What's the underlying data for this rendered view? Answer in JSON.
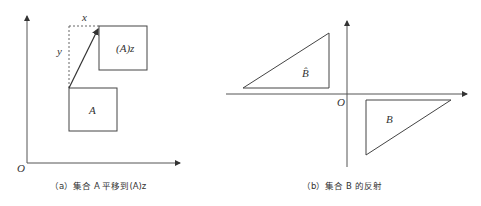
{
  "panel_a": {
    "caption": "（a）集合 A 平移到(A)z",
    "origin_label": "O",
    "set_label": "A",
    "translated_label": "(A)z",
    "x_offset_label": "x",
    "y_offset_label": "y"
  },
  "panel_b": {
    "caption": "（b）集合 B 的反射",
    "origin_label": "O",
    "set_label": "B",
    "reflected_label": "B̂"
  },
  "colors": {
    "line": "#444444",
    "dashed": "#666666",
    "text": "#333333"
  }
}
